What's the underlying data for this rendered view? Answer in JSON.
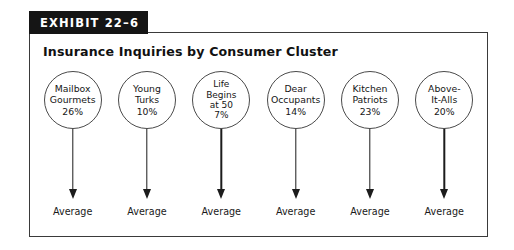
{
  "exhibit": {
    "banner_label": "EXHIBIT 22–6",
    "title": "Insurance Inquiries by Consumer Cluster",
    "banner_color": "#151515",
    "banner_text_color": "#ffffff",
    "frame_border_color": "#3a3a3a",
    "circle_border_color": "#4a4a4a",
    "arrow_color": "#1c1c1c"
  },
  "chart_data": {
    "type": "diagram",
    "title": "Insurance Inquiries by Consumer Cluster",
    "xlabel": "",
    "ylabel": "",
    "categories": [
      "Mailbox Gourmets",
      "Young Turks",
      "Life Begins at 50",
      "Dear Occupants",
      "Kitchen Patriots",
      "Above-It-Alls"
    ],
    "values": [
      26,
      10,
      7,
      14,
      23,
      20
    ],
    "value_unit": "%",
    "outcome_labels": [
      "Average",
      "Average",
      "Average",
      "Average",
      "Average",
      "Average"
    ],
    "legend": [],
    "grid": false
  },
  "clusters": [
    {
      "lines": [
        "Mailbox",
        "Gourmets",
        "26%"
      ],
      "name": "Mailbox Gourmets",
      "value": "26%",
      "outcome": "Average"
    },
    {
      "lines": [
        "Young",
        "Turks",
        "10%"
      ],
      "name": "Young Turks",
      "value": "10%",
      "outcome": "Average"
    },
    {
      "lines": [
        "Life",
        "Begins",
        "at 50",
        "7%"
      ],
      "name": "Life Begins at 50",
      "value": "7%",
      "outcome": "Average"
    },
    {
      "lines": [
        "Dear",
        "Occupants",
        "14%"
      ],
      "name": "Dear Occupants",
      "value": "14%",
      "outcome": "Average"
    },
    {
      "lines": [
        "Kitchen",
        "Patriots",
        "23%"
      ],
      "name": "Kitchen Patriots",
      "value": "23%",
      "outcome": "Average"
    },
    {
      "lines": [
        "Above-",
        "It-Alls",
        "20%"
      ],
      "name": "Above-It-Alls",
      "value": "20%",
      "outcome": "Average"
    }
  ]
}
